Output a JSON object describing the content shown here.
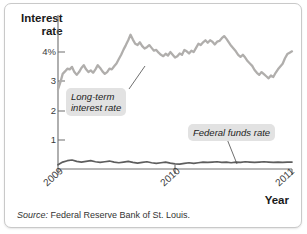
{
  "figure": {
    "source_prefix": "Source:",
    "source_text": "Federal Reserve Bank of St. Louis."
  },
  "chart_data": {
    "type": "line",
    "title": "",
    "ylabel_line1": "Interest",
    "ylabel_line2": "rate",
    "xlabel": "Year",
    "grid": false,
    "legend_position": "inline-annotations",
    "ylim": [
      0,
      4.45
    ],
    "xlim": [
      2009.0,
      2011.0
    ],
    "yticks": [
      1,
      2,
      3,
      4
    ],
    "ytick_labels": [
      "1",
      "2",
      "3",
      "4%"
    ],
    "xticks": [
      2009,
      2010,
      2011
    ],
    "xtick_labels": [
      "2009",
      "2010",
      "2011"
    ],
    "annotations": [
      {
        "name": "long-term-interest-rate",
        "text_line1": "Long-term",
        "text_line2": "interest rate"
      },
      {
        "name": "federal-funds-rate",
        "text_line1": "Federal funds rate",
        "text_line2": ""
      }
    ],
    "series": [
      {
        "name": "Long-term interest rate",
        "color": "#b0aeac",
        "x": [
          2009.0,
          2009.02,
          2009.04,
          2009.06,
          2009.08,
          2009.1,
          2009.12,
          2009.14,
          2009.16,
          2009.18,
          2009.2,
          2009.22,
          2009.24,
          2009.26,
          2009.28,
          2009.3,
          2009.32,
          2009.34,
          2009.36,
          2009.38,
          2009.4,
          2009.42,
          2009.44,
          2009.46,
          2009.48,
          2009.5,
          2009.52,
          2009.54,
          2009.56,
          2009.58,
          2009.6,
          2009.62,
          2009.64,
          2009.66,
          2009.68,
          2009.7,
          2009.72,
          2009.74,
          2009.76,
          2009.78,
          2009.8,
          2009.82,
          2009.84,
          2009.86,
          2009.88,
          2009.9,
          2009.92,
          2009.94,
          2009.96,
          2009.98,
          2010.0,
          2010.02,
          2010.04,
          2010.06,
          2010.08,
          2010.1,
          2010.12,
          2010.14,
          2010.16,
          2010.18,
          2010.2,
          2010.22,
          2010.24,
          2010.26,
          2010.28,
          2010.3,
          2010.32,
          2010.34,
          2010.36,
          2010.38,
          2010.4,
          2010.42,
          2010.44,
          2010.46,
          2010.48,
          2010.5,
          2010.52,
          2010.54,
          2010.56,
          2010.58,
          2010.6,
          2010.62,
          2010.64,
          2010.66,
          2010.68,
          2010.7,
          2010.72,
          2010.74,
          2010.76,
          2010.78,
          2010.8,
          2010.82,
          2010.84,
          2010.86,
          2010.88,
          2010.9,
          2010.92,
          2010.94,
          2010.96,
          2010.98,
          2011.0
        ],
        "y": [
          2.3,
          2.5,
          2.75,
          2.82,
          2.9,
          2.88,
          2.95,
          2.8,
          2.72,
          2.8,
          2.92,
          3.0,
          2.88,
          2.8,
          2.85,
          2.78,
          2.88,
          3.0,
          2.92,
          2.82,
          2.75,
          2.8,
          2.9,
          2.88,
          2.97,
          3.05,
          3.18,
          3.3,
          3.45,
          3.58,
          3.72,
          3.88,
          3.74,
          3.62,
          3.58,
          3.66,
          3.55,
          3.48,
          3.52,
          3.58,
          3.5,
          3.42,
          3.44,
          3.36,
          3.3,
          3.26,
          3.33,
          3.28,
          3.38,
          3.3,
          3.22,
          3.26,
          3.34,
          3.3,
          3.44,
          3.4,
          3.34,
          3.42,
          3.38,
          3.5,
          3.62,
          3.58,
          3.66,
          3.72,
          3.65,
          3.72,
          3.68,
          3.6,
          3.68,
          3.7,
          3.78,
          3.84,
          3.76,
          3.66,
          3.56,
          3.48,
          3.4,
          3.3,
          3.24,
          3.3,
          3.22,
          3.12,
          3.05,
          2.98,
          2.86,
          2.78,
          2.72,
          2.8,
          2.74,
          2.68,
          2.62,
          2.7,
          2.66,
          2.78,
          2.88,
          2.96,
          3.04,
          3.2,
          3.32,
          3.36,
          3.4
        ]
      },
      {
        "name": "Federal funds rate",
        "color": "#5d5d5d",
        "x": [
          2009.0,
          2009.04,
          2009.08,
          2009.12,
          2009.16,
          2009.2,
          2009.24,
          2009.28,
          2009.32,
          2009.36,
          2009.4,
          2009.44,
          2009.48,
          2009.52,
          2009.56,
          2009.6,
          2009.64,
          2009.68,
          2009.72,
          2009.76,
          2009.8,
          2009.84,
          2009.88,
          2009.92,
          2009.96,
          2010.0,
          2010.04,
          2010.08,
          2010.12,
          2010.16,
          2010.2,
          2010.24,
          2010.28,
          2010.32,
          2010.36,
          2010.4,
          2010.44,
          2010.48,
          2010.52,
          2010.56,
          2010.6,
          2010.64,
          2010.68,
          2010.72,
          2010.76,
          2010.8,
          2010.84,
          2010.88,
          2010.92,
          2010.96,
          2011.0
        ],
        "y": [
          0.12,
          0.2,
          0.24,
          0.26,
          0.22,
          0.2,
          0.22,
          0.24,
          0.21,
          0.19,
          0.21,
          0.23,
          0.2,
          0.18,
          0.2,
          0.22,
          0.19,
          0.17,
          0.19,
          0.21,
          0.18,
          0.16,
          0.18,
          0.2,
          0.17,
          0.15,
          0.14,
          0.16,
          0.18,
          0.16,
          0.18,
          0.2,
          0.19,
          0.2,
          0.21,
          0.19,
          0.2,
          0.18,
          0.2,
          0.19,
          0.21,
          0.2,
          0.19,
          0.2,
          0.21,
          0.2,
          0.19,
          0.2,
          0.19,
          0.2,
          0.2
        ]
      }
    ]
  }
}
